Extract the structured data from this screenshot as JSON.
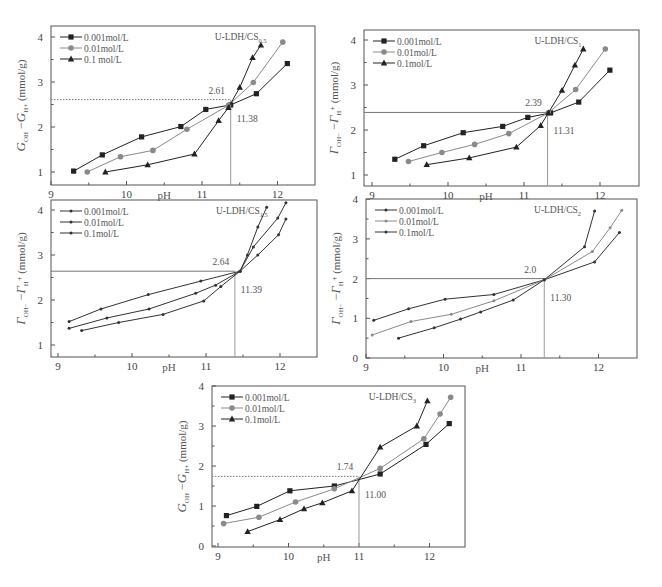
{
  "figure": {
    "panels_count": 5
  },
  "chart_data": [
    {
      "type": "line",
      "title": "U-LDH/CS0.5",
      "title_main": "U-LDH/CS",
      "title_sub": "0.5",
      "xlabel": "pH",
      "ylabel": "G_OH- - G_H+ (mmol/g)",
      "ylabel_main": "G",
      "xlim": [
        8.95,
        12.5
      ],
      "ylim": [
        0.75,
        4.25
      ],
      "xticks": [
        9,
        10,
        11,
        12
      ],
      "yticks": [
        1,
        2,
        3,
        4
      ],
      "grid": false,
      "legend_position": "upper left",
      "box": {
        "x0": 51,
        "y0": 26,
        "x1": 315,
        "y1": 185
      },
      "px": {
        "x9": 51,
        "xStep": 75.5,
        "yRef": 1,
        "yRefPx": 172,
        "yStep": 45
      },
      "intersection": {
        "x": 11.38,
        "y": 2.61,
        "x_label": "11.38",
        "y_label": "2.61",
        "dotted": true
      },
      "series": [
        {
          "name": "0.001mol/L",
          "marker": "square",
          "color": "#222222",
          "x": [
            9.3,
            9.68,
            10.2,
            10.72,
            11.05,
            11.38,
            11.72,
            12.13
          ],
          "y": [
            1.02,
            1.38,
            1.78,
            2.01,
            2.39,
            2.49,
            2.74,
            3.41
          ]
        },
        {
          "name": "0.01mol/L",
          "marker": "circle",
          "color": "#8a8a8a",
          "x": [
            9.48,
            9.92,
            10.35,
            10.8,
            11.35,
            11.68,
            12.07
          ],
          "y": [
            1.0,
            1.34,
            1.48,
            1.95,
            2.48,
            2.99,
            3.89
          ]
        },
        {
          "name": "0.1 mol/L",
          "marker": "triangle",
          "color": "#222222",
          "x": [
            9.72,
            10.28,
            10.9,
            11.22,
            11.35,
            11.5,
            11.67,
            11.78
          ],
          "y": [
            1.0,
            1.16,
            1.4,
            2.14,
            2.43,
            2.88,
            3.54,
            3.82
          ]
        }
      ]
    },
    {
      "type": "line",
      "title": "U-LDH/CS1",
      "title_main": "U-LDH/CS",
      "title_sub": "1",
      "xlabel": "pH",
      "ylabel": "Γ_OH- - Γ_H+ (mmol/g)",
      "ylabel_main": "Γ",
      "xlim": [
        8.9,
        12.5
      ],
      "ylim": [
        0.75,
        4.25
      ],
      "xticks": [
        9,
        10,
        11,
        12
      ],
      "yticks": [
        1,
        2,
        3,
        4
      ],
      "grid": false,
      "legend_position": "upper left",
      "box": {
        "x0": 364,
        "y0": 30,
        "x1": 639,
        "y1": 186
      },
      "px": {
        "x9": 372,
        "xStep": 76,
        "yRef": 1,
        "yRefPx": 175,
        "yStep": 45
      },
      "intersection": {
        "x": 11.31,
        "y": 2.39,
        "x_label": "11.31",
        "y_label": "2.39",
        "dotted": false
      },
      "series": [
        {
          "name": "0.001mol/L",
          "marker": "square",
          "color": "#222222",
          "x": [
            9.3,
            9.68,
            10.2,
            10.72,
            11.05,
            11.35,
            11.72,
            12.13
          ],
          "y": [
            1.35,
            1.65,
            1.94,
            2.08,
            2.28,
            2.38,
            2.62,
            3.33
          ]
        },
        {
          "name": "0.01mol/L",
          "marker": "circle",
          "color": "#8a8a8a",
          "x": [
            9.48,
            9.92,
            10.35,
            10.8,
            11.32,
            11.68,
            12.07
          ],
          "y": [
            1.3,
            1.5,
            1.68,
            1.92,
            2.38,
            2.9,
            3.8
          ]
        },
        {
          "name": "0.1mol/L",
          "marker": "triangle",
          "color": "#222222",
          "x": [
            9.72,
            10.28,
            10.9,
            11.22,
            11.32,
            11.5,
            11.67,
            11.78
          ],
          "y": [
            1.23,
            1.38,
            1.62,
            2.1,
            2.38,
            2.88,
            3.44,
            3.8
          ]
        }
      ]
    },
    {
      "type": "line",
      "title": "U-LDH/CS1.5",
      "title_main": "U-LDH/CS",
      "title_sub": "1.5",
      "xlabel": "pH",
      "ylabel": "Γ_OH- - Γ_H+ (mmol/g)",
      "ylabel_main": "Γ",
      "xlim": [
        8.9,
        12.5
      ],
      "ylim": [
        0.75,
        4.25
      ],
      "xticks": [
        9,
        10,
        11,
        12
      ],
      "yticks": [
        1,
        2,
        3,
        4
      ],
      "grid": false,
      "legend_position": "upper left",
      "box": {
        "x0": 51,
        "y0": 200,
        "x1": 317,
        "y1": 357
      },
      "px": {
        "x9": 58,
        "xStep": 74,
        "yRef": 1,
        "yRefPx": 345,
        "yStep": 45
      },
      "intersection": {
        "x": 11.39,
        "y": 2.64,
        "x_label": "11.39",
        "y_label": "2.64",
        "dotted": false
      },
      "series": [
        {
          "name": "0.001mol/L",
          "marker": "dot",
          "color": "#333333",
          "x": [
            9.15,
            9.58,
            10.22,
            10.93,
            11.46,
            11.7,
            11.98,
            12.08
          ],
          "y": [
            1.52,
            1.8,
            2.12,
            2.42,
            2.64,
            3.0,
            3.45,
            3.8
          ]
        },
        {
          "name": "0.01mol/L",
          "marker": "dot",
          "color": "#333333",
          "x": [
            9.15,
            9.66,
            10.23,
            10.86,
            11.13,
            11.46,
            11.64,
            11.97,
            12.08
          ],
          "y": [
            1.37,
            1.6,
            1.8,
            2.15,
            2.33,
            2.64,
            3.18,
            3.82,
            4.16
          ]
        },
        {
          "name": "0.1mol/L",
          "marker": "dot",
          "color": "#333333",
          "x": [
            9.32,
            9.82,
            10.42,
            10.97,
            11.2,
            11.46,
            11.56,
            11.7,
            11.82
          ],
          "y": [
            1.32,
            1.5,
            1.68,
            1.98,
            2.3,
            2.64,
            3.0,
            3.62,
            4.06
          ]
        }
      ]
    },
    {
      "type": "line",
      "title": "U-LDH/CS2",
      "title_main": "U-LDH/CS",
      "title_sub": "2",
      "xlabel": "pH",
      "ylabel": "Γ_OH- - Γ_H+ (mmol/g)",
      "ylabel_main": "Γ",
      "xlim": [
        9.0,
        12.5
      ],
      "ylim": [
        0,
        4
      ],
      "xticks": [
        9,
        10,
        11,
        12
      ],
      "yticks": [
        0,
        1,
        2,
        3,
        4
      ],
      "grid": false,
      "legend_position": "upper left",
      "box": {
        "x0": 366,
        "y0": 199,
        "x1": 637,
        "y1": 358
      },
      "px": {
        "x9": 366,
        "xStep": 77.5,
        "yRef": 0,
        "yRefPx": 358,
        "yStep": 39.7
      },
      "intersection": {
        "x": 11.3,
        "y": 2.0,
        "x_label": "11.30",
        "y_label": "2.0",
        "dotted": false
      },
      "series": [
        {
          "name": "0.001mol/L",
          "marker": "dot",
          "color": "#333333",
          "x": [
            9.1,
            9.55,
            10.02,
            10.65,
            11.3,
            11.95,
            12.27
          ],
          "y": [
            0.95,
            1.24,
            1.48,
            1.6,
            1.97,
            2.42,
            3.16
          ]
        },
        {
          "name": "0.01mol/L",
          "marker": "dot",
          "color": "#8a8a8a",
          "x": [
            9.08,
            9.58,
            10.1,
            10.65,
            11.3,
            11.92,
            12.15,
            12.3
          ],
          "y": [
            0.58,
            0.92,
            1.1,
            1.44,
            1.97,
            2.68,
            3.28,
            3.72
          ]
        },
        {
          "name": "0.1mol/L",
          "marker": "dot",
          "color": "#333333",
          "x": [
            9.42,
            9.88,
            10.22,
            10.48,
            10.9,
            11.3,
            11.82,
            11.95
          ],
          "y": [
            0.5,
            0.76,
            0.98,
            1.16,
            1.46,
            1.97,
            2.8,
            3.7
          ]
        }
      ]
    },
    {
      "type": "line",
      "title": "U-LDH/CS3",
      "title_main": "U-LDH/CS",
      "title_sub": "3",
      "xlabel": "pH",
      "ylabel": "G_OH- - G_H+ (mmol/g)",
      "ylabel_main": "G",
      "xlim": [
        8.9,
        12.5
      ],
      "ylim": [
        0,
        4
      ],
      "xticks": [
        9,
        10,
        11,
        12
      ],
      "yticks": [
        0,
        1,
        2,
        3,
        4
      ],
      "grid": false,
      "legend_position": "upper left",
      "box": {
        "x0": 212,
        "y0": 386,
        "x1": 465,
        "y1": 547
      },
      "px": {
        "x9": 218,
        "xStep": 70.5,
        "yRef": 0,
        "yRefPx": 546,
        "yStep": 40
      },
      "intersection": {
        "x": 11.0,
        "y": 1.74,
        "x_label": "11.00",
        "y_label": "1.74",
        "dotted": true
      },
      "series": [
        {
          "name": "0.001mol/L",
          "marker": "square",
          "color": "#222222",
          "x": [
            9.12,
            9.55,
            10.02,
            10.65,
            11.3,
            11.95,
            12.28
          ],
          "y": [
            0.76,
            0.99,
            1.38,
            1.5,
            1.8,
            2.54,
            3.06
          ]
        },
        {
          "name": "0.01mol/L",
          "marker": "circle",
          "color": "#8a8a8a",
          "x": [
            9.08,
            9.58,
            10.1,
            10.65,
            11.3,
            11.92,
            12.15,
            12.3
          ],
          "y": [
            0.56,
            0.72,
            1.1,
            1.43,
            1.94,
            2.68,
            3.3,
            3.72
          ]
        },
        {
          "name": "0.1mol/L",
          "marker": "triangle",
          "color": "#222222",
          "x": [
            9.42,
            9.88,
            10.22,
            10.48,
            10.9,
            11.3,
            11.82,
            11.97
          ],
          "y": [
            0.36,
            0.66,
            0.93,
            1.08,
            1.38,
            2.47,
            3.0,
            3.63
          ]
        }
      ]
    }
  ]
}
